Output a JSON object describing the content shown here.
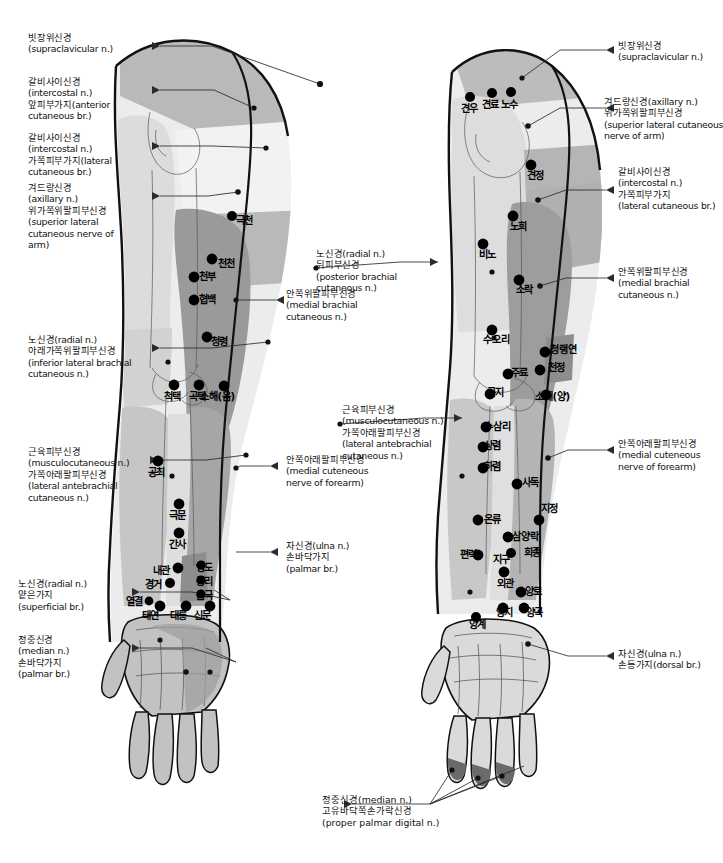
{
  "figure": {
    "views": [
      {
        "id": "anterior",
        "label": "anterior view (left figure)"
      },
      {
        "id": "posterior",
        "label": "posterior view (right figure)"
      }
    ]
  },
  "colors": {
    "skin_light": "#e9e9e9",
    "skin_mid": "#c9c9c9",
    "skin_dark": "#a8a8a8",
    "skin_darker": "#8f8f8f",
    "outline": "#111111",
    "point": "#000000",
    "leader": "#2b2b2b",
    "text": "#111111",
    "background": "#ffffff"
  },
  "nerve_labels_left": [
    {
      "id": "supraclavicular-l",
      "lines": [
        "빗장위신경",
        "(supraclavicular n.)"
      ]
    },
    {
      "id": "intercostal-anterior-l",
      "lines": [
        "갈비사이신경",
        "(intercostal n.)",
        "앞피부가지(anterior",
        "cutaneous br.)"
      ]
    },
    {
      "id": "intercostal-lateral-l",
      "lines": [
        "갈비사이신경",
        "(intercostal n.)",
        "가쪽피부가지(lateral",
        "cutaneous br.)"
      ]
    },
    {
      "id": "axillary-superior-lateral-l",
      "lines": [
        "겨드랑신경",
        "(axillary n.)",
        "위가쪽위팔피부신경",
        "(superior lateral",
        "cutaneous nerve of",
        "arm)"
      ]
    },
    {
      "id": "radial-inferior-lateral-brachial-l",
      "lines": [
        "노신경(radial n.)",
        "아래가쪽위팔피부신경",
        "(inferior lateral brachial",
        "cutaneous n.)"
      ]
    },
    {
      "id": "musculocutaneous-lateral-antebrachial-l",
      "lines": [
        "근육피부신경",
        "(musculocutaneous n.)",
        "가쪽아래팔피부신경",
        "(lateral antebrachial",
        "cutaneous n.)"
      ]
    },
    {
      "id": "radial-superficial-l",
      "lines": [
        "노신경(radial n.)",
        "얕은가지",
        "(superficial br.)"
      ]
    },
    {
      "id": "median-palmar-l",
      "lines": [
        "정중신경",
        "(median n.)",
        "손바닥가지",
        "(palmar br.)"
      ]
    }
  ],
  "nerve_labels_center": [
    {
      "id": "radial-posterior-brachial-c",
      "lines": [
        "노신경(radial n.)",
        "뒤피부신경",
        "(posterior brachial",
        "cutaneous n.)"
      ]
    },
    {
      "id": "medial-brachial-cutaneous-c",
      "lines": [
        "안쪽위팔피부신경",
        "(medial brachial",
        "cutaneous n.)"
      ]
    },
    {
      "id": "musculocutaneous-lateral-antebrachial-c",
      "lines": [
        "근육피부신경",
        "(musculocutaneous n.)",
        "가쪽아래팔피부신경",
        "(lateral antebrachial",
        "cutaneous n.)"
      ]
    },
    {
      "id": "medial-antebrachial-cutaneous-c",
      "lines": [
        "안쪽아래팔피부신경",
        "(medial cuteneous",
        "nerve of forearm)"
      ]
    },
    {
      "id": "ulna-palmar-c",
      "lines": [
        "자신경(ulna n.)",
        "손바닥가지",
        "(palmar br.)"
      ]
    }
  ],
  "nerve_labels_right": [
    {
      "id": "supraclavicular-r",
      "lines": [
        "빗장위신경",
        "(supraclavicular n.)"
      ]
    },
    {
      "id": "axillary-superior-lateral-r",
      "lines": [
        "겨드랑신경(axillary n.)",
        "위가쪽위팔피부신경",
        "(superior lateral cutaneous",
        "nerve of arm)"
      ]
    },
    {
      "id": "intercostal-lateral-r",
      "lines": [
        "갈비사이신경",
        "(intercostal n.)",
        "가쪽피부가지",
        "(lateral cutaneous br.)"
      ]
    },
    {
      "id": "medial-brachial-cutaneous-r",
      "lines": [
        "안쪽위팔피부신경",
        "(medial brachial",
        "cutaneous n.)"
      ]
    },
    {
      "id": "medial-antebrachial-cutaneous-r",
      "lines": [
        "안쪽아래팔피부신경",
        "(medial cuteneous",
        "nerve of forearm)"
      ]
    },
    {
      "id": "ulna-dorsal-r",
      "lines": [
        "자신경(ulna n.)",
        "손등가지(dorsal br.)"
      ]
    }
  ],
  "caption_bottom": {
    "id": "median-proper-palmar-digital",
    "lines": [
      "정중신경(median n.)",
      "고유바닥쪽손가락신경",
      "(proper palmar digital n.)"
    ]
  },
  "acupoints_left": [
    {
      "name": "극천",
      "x": 246,
      "y": 221
    },
    {
      "name": "천천",
      "x": 228,
      "y": 264
    },
    {
      "name": "천부",
      "x": 209,
      "y": 277
    },
    {
      "name": "협백",
      "x": 209,
      "y": 300
    },
    {
      "name": "청령",
      "x": 221,
      "y": 342
    },
    {
      "name": "척택",
      "x": 174,
      "y": 397
    },
    {
      "name": "곡택",
      "x": 199,
      "y": 397
    },
    {
      "name": "소해(음)",
      "x": 226,
      "y": 397
    },
    {
      "name": "공최",
      "x": 158,
      "y": 473
    },
    {
      "name": "극문",
      "x": 179,
      "y": 516
    },
    {
      "name": "간사",
      "x": 179,
      "y": 545
    },
    {
      "name": "내관",
      "x": 163,
      "y": 571
    },
    {
      "name": "영도",
      "x": 206,
      "y": 568
    },
    {
      "name": "경거",
      "x": 155,
      "y": 585
    },
    {
      "name": "통리",
      "x": 206,
      "y": 582
    },
    {
      "name": "음극",
      "x": 206,
      "y": 596
    },
    {
      "name": "열결",
      "x": 136,
      "y": 602
    },
    {
      "name": "태연",
      "x": 152,
      "y": 616
    },
    {
      "name": "대릉",
      "x": 180,
      "y": 616
    },
    {
      "name": "신문",
      "x": 204,
      "y": 616
    }
  ],
  "acupoints_right": [
    {
      "name": "견우",
      "x": 471,
      "y": 109
    },
    {
      "name": "견료",
      "x": 492,
      "y": 105
    },
    {
      "name": "노수",
      "x": 511,
      "y": 105
    },
    {
      "name": "견정",
      "x": 537,
      "y": 176
    },
    {
      "name": "노회",
      "x": 520,
      "y": 227
    },
    {
      "name": "비노",
      "x": 489,
      "y": 255
    },
    {
      "name": "소락",
      "x": 526,
      "y": 290
    },
    {
      "name": "수오리",
      "x": 499,
      "y": 340
    },
    {
      "name": "청랭연",
      "x": 566,
      "y": 350
    },
    {
      "name": "천정",
      "x": 558,
      "y": 368
    },
    {
      "name": "주료",
      "x": 521,
      "y": 373
    },
    {
      "name": "곡지",
      "x": 497,
      "y": 393
    },
    {
      "name": "소해(양)",
      "x": 561,
      "y": 397
    },
    {
      "name": "수삼리",
      "x": 500,
      "y": 427
    },
    {
      "name": "상렴",
      "x": 494,
      "y": 446
    },
    {
      "name": "하렴",
      "x": 494,
      "y": 467
    },
    {
      "name": "사독",
      "x": 532,
      "y": 483
    },
    {
      "name": "지정",
      "x": 551,
      "y": 509
    },
    {
      "name": "온류",
      "x": 494,
      "y": 520
    },
    {
      "name": "삼양락",
      "x": 528,
      "y": 537
    },
    {
      "name": "편력",
      "x": 470,
      "y": 555
    },
    {
      "name": "지구",
      "x": 503,
      "y": 560
    },
    {
      "name": "회종",
      "x": 534,
      "y": 553
    },
    {
      "name": "외관",
      "x": 507,
      "y": 584
    },
    {
      "name": "양로",
      "x": 535,
      "y": 592
    },
    {
      "name": "양지",
      "x": 506,
      "y": 613
    },
    {
      "name": "양곡",
      "x": 536,
      "y": 613
    },
    {
      "name": "양계",
      "x": 479,
      "y": 625
    }
  ]
}
